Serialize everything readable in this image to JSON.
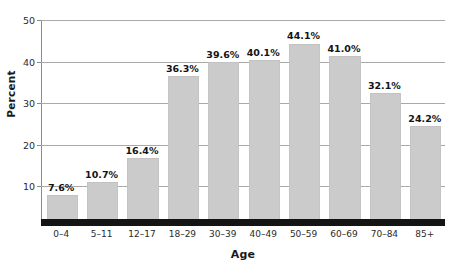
{
  "chart_data": {
    "type": "bar",
    "title": "",
    "subtitle": "",
    "xlabel": "Age",
    "ylabel": "Percent",
    "categories": [
      "0–4",
      "5–11",
      "12–17",
      "18–29",
      "30–39",
      "40–49",
      "50–59",
      "60–69",
      "70–84",
      "85+"
    ],
    "values": [
      7.6,
      10.7,
      16.4,
      36.3,
      39.6,
      40.1,
      44.1,
      41.0,
      32.1,
      24.2
    ],
    "data_labels": [
      "7.6%",
      "10.7%",
      "16.4%",
      "36.3%",
      "39.6%",
      "40.1%",
      "44.1%",
      "41.0%",
      "32.1%",
      "24.2%"
    ],
    "ylim": [
      0,
      50
    ],
    "yticks": [
      10,
      20,
      30,
      40,
      50
    ],
    "ytick_labels": [
      "10",
      "20",
      "30",
      "40",
      "50"
    ],
    "grid": "horizontal",
    "legend": "none",
    "bar_color": "#cbcbcb",
    "baseline_color": "#141414",
    "grid_color": "#a9a9a9",
    "text_color": "#1a1a1a"
  }
}
